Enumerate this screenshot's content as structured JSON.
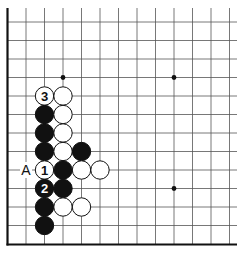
{
  "diagram": {
    "type": "go-board-fragment",
    "visible_columns": 13,
    "visible_rows": 13,
    "edges": [
      "left",
      "bottom"
    ],
    "colors": {
      "black_stone": "#111111",
      "white_stone": "#ffffff",
      "stone_outline": "#111111",
      "grid_line": "#555555",
      "edge_line": "#111111",
      "background": "#ffffff"
    },
    "star_points": [
      {
        "col": 3,
        "row": 3
      },
      {
        "col": 9,
        "row": 3
      },
      {
        "col": 9,
        "row": 9
      }
    ],
    "stones": [
      {
        "col": 2,
        "row": 4,
        "color": "white",
        "label": "3"
      },
      {
        "col": 3,
        "row": 4,
        "color": "white",
        "label": ""
      },
      {
        "col": 2,
        "row": 5,
        "color": "black",
        "label": ""
      },
      {
        "col": 3,
        "row": 5,
        "color": "white",
        "label": ""
      },
      {
        "col": 2,
        "row": 6,
        "color": "black",
        "label": ""
      },
      {
        "col": 3,
        "row": 6,
        "color": "white",
        "label": ""
      },
      {
        "col": 2,
        "row": 7,
        "color": "black",
        "label": ""
      },
      {
        "col": 3,
        "row": 7,
        "color": "white",
        "label": ""
      },
      {
        "col": 4,
        "row": 7,
        "color": "black",
        "label": ""
      },
      {
        "col": 2,
        "row": 8,
        "color": "white",
        "label": "1"
      },
      {
        "col": 3,
        "row": 8,
        "color": "black",
        "label": ""
      },
      {
        "col": 4,
        "row": 8,
        "color": "white",
        "label": ""
      },
      {
        "col": 5,
        "row": 8,
        "color": "white",
        "label": ""
      },
      {
        "col": 2,
        "row": 9,
        "color": "black",
        "label": "2"
      },
      {
        "col": 3,
        "row": 9,
        "color": "black",
        "label": ""
      },
      {
        "col": 2,
        "row": 10,
        "color": "black",
        "label": ""
      },
      {
        "col": 3,
        "row": 10,
        "color": "white",
        "label": ""
      },
      {
        "col": 4,
        "row": 10,
        "color": "white",
        "label": ""
      },
      {
        "col": 2,
        "row": 11,
        "color": "black",
        "label": ""
      }
    ],
    "marks": [
      {
        "col": 1,
        "row": 8,
        "text": "A"
      }
    ]
  }
}
